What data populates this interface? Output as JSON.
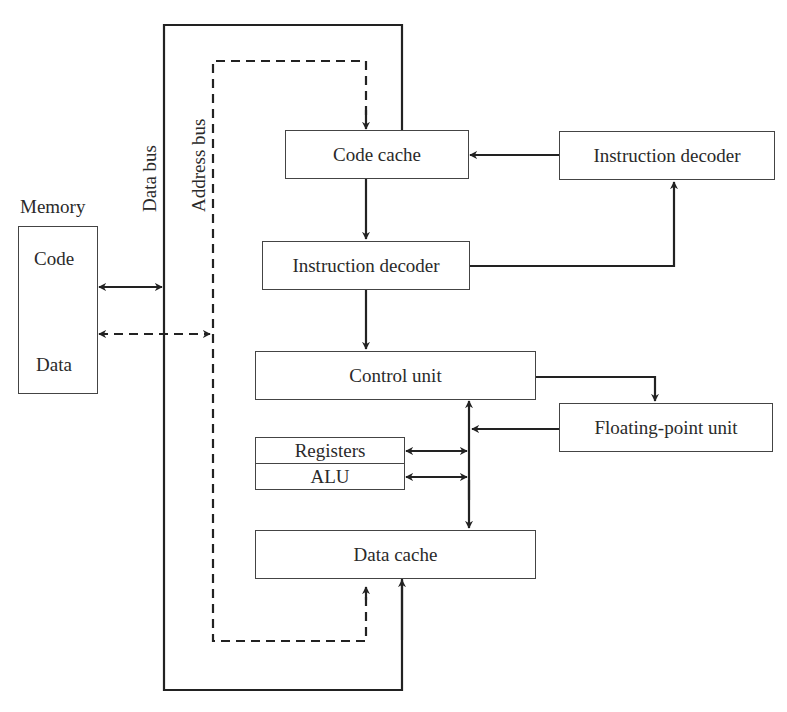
{
  "diagram": {
    "memory": {
      "title": "Memory",
      "sections": [
        "Code",
        "Data"
      ]
    },
    "buses": {
      "data_bus": "Data bus",
      "address_bus": "Address bus"
    },
    "blocks": {
      "code_cache": "Code cache",
      "instruction_decoder_right": "Instruction decoder",
      "instruction_decoder_mid": "Instruction decoder",
      "control_unit": "Control unit",
      "floating_point_unit": "Floating-point unit",
      "registers": "Registers",
      "alu": "ALU",
      "data_cache": "Data cache"
    },
    "connections": [
      {
        "from": "Memory.Code",
        "to": "Data bus",
        "style": "solid",
        "direction": "bidirectional"
      },
      {
        "from": "Memory.Data",
        "to": "Address bus",
        "style": "dashed",
        "direction": "bidirectional"
      },
      {
        "from": "Address bus",
        "to": "Code cache",
        "style": "dashed",
        "direction": "forward"
      },
      {
        "from": "Address bus",
        "to": "Data cache",
        "style": "dashed",
        "direction": "forward"
      },
      {
        "from": "Data bus",
        "to": "Data cache",
        "style": "solid",
        "direction": "forward"
      },
      {
        "from": "Instruction decoder (right)",
        "to": "Code cache",
        "style": "solid",
        "direction": "forward"
      },
      {
        "from": "Code cache",
        "to": "Instruction decoder (mid)",
        "style": "solid",
        "direction": "forward"
      },
      {
        "from": "Instruction decoder (mid)",
        "to": "Instruction decoder (right)",
        "style": "solid",
        "direction": "forward"
      },
      {
        "from": "Instruction decoder (mid)",
        "to": "Control unit",
        "style": "solid",
        "direction": "forward"
      },
      {
        "from": "Control unit",
        "to": "Floating-point unit",
        "style": "solid",
        "direction": "forward"
      },
      {
        "from": "Floating-point unit",
        "to": "Internal bus",
        "style": "solid",
        "direction": "forward"
      },
      {
        "from": "Registers",
        "to": "Internal bus",
        "style": "solid",
        "direction": "bidirectional"
      },
      {
        "from": "ALU",
        "to": "Internal bus",
        "style": "solid",
        "direction": "bidirectional"
      },
      {
        "from": "Internal bus",
        "to": "Control unit",
        "style": "solid",
        "direction": "forward"
      },
      {
        "from": "Internal bus",
        "to": "Data cache",
        "style": "solid",
        "direction": "forward"
      }
    ],
    "colors": {
      "line": "#222222",
      "box_border": "#444444",
      "background": "#ffffff"
    }
  }
}
